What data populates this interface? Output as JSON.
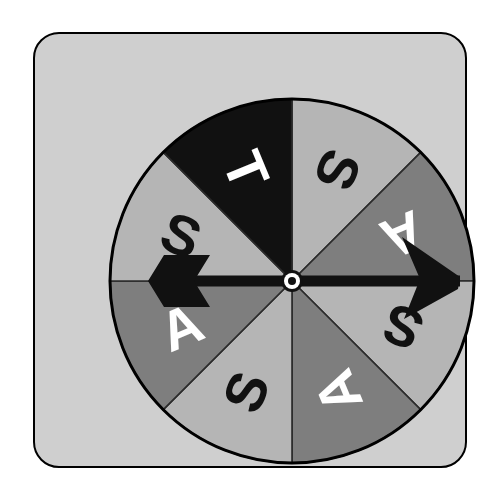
{
  "image": {
    "kind": "spinner-wheel-illustration",
    "background_color": "#ffffff"
  },
  "panel": {
    "name": "rounded-frame",
    "background_color": "#cfcfcf",
    "border_color": "#000000",
    "corner_radius": 26
  },
  "wheel": {
    "title": "eight-sector-spinner",
    "center_x": 186,
    "center_y": 186,
    "radius": 182,
    "rim_color": "#000000",
    "sector_count": 8,
    "sector_angle_deg": 45,
    "colors": {
      "light": "#b5b5b5",
      "dark": "#7e7e7e",
      "black": "#111111",
      "letter_dark": "#111111",
      "letter_light": "#ffffff"
    },
    "sectors": [
      {
        "index": 0,
        "label": "S",
        "fill": "#b5b5b5",
        "fill_name": "light",
        "text_color": "#111111",
        "start_deg": 0,
        "end_deg": 45,
        "label_angle_deg": 22.5,
        "label_rotation_deg": 112.5,
        "label_radius": 120
      },
      {
        "index": 1,
        "label": "A",
        "fill": "#7e7e7e",
        "fill_name": "dark",
        "text_color": "#ffffff",
        "start_deg": 45,
        "end_deg": 90,
        "label_angle_deg": 67.5,
        "label_rotation_deg": 157.5,
        "label_radius": 120
      },
      {
        "index": 2,
        "label": "S",
        "fill": "#b5b5b5",
        "fill_name": "light",
        "text_color": "#111111",
        "start_deg": 90,
        "end_deg": 135,
        "label_angle_deg": 112.5,
        "label_rotation_deg": 202.5,
        "label_radius": 120
      },
      {
        "index": 3,
        "label": "A",
        "fill": "#7e7e7e",
        "fill_name": "dark",
        "text_color": "#ffffff",
        "start_deg": 135,
        "end_deg": 180,
        "label_angle_deg": 157.5,
        "label_rotation_deg": 247.5,
        "label_radius": 120
      },
      {
        "index": 4,
        "label": "S",
        "fill": "#b5b5b5",
        "fill_name": "light",
        "text_color": "#111111",
        "start_deg": 180,
        "end_deg": 225,
        "label_angle_deg": 202.5,
        "label_rotation_deg": 292.5,
        "label_radius": 120
      },
      {
        "index": 5,
        "label": "A",
        "fill": "#7e7e7e",
        "fill_name": "dark",
        "text_color": "#ffffff",
        "start_deg": 225,
        "end_deg": 270,
        "label_angle_deg": 247.5,
        "label_rotation_deg": 337.5,
        "label_radius": 120
      },
      {
        "index": 6,
        "label": "S",
        "fill": "#b5b5b5",
        "fill_name": "light",
        "text_color": "#111111",
        "start_deg": 270,
        "end_deg": 315,
        "label_angle_deg": 292.5,
        "label_rotation_deg": 22.5,
        "label_radius": 120
      },
      {
        "index": 7,
        "label": "T",
        "fill": "#111111",
        "fill_name": "black",
        "text_color": "#ffffff",
        "start_deg": 315,
        "end_deg": 360,
        "label_angle_deg": 337.5,
        "label_rotation_deg": 67.5,
        "label_radius": 120
      }
    ],
    "pointer": {
      "name": "spinner-arrow",
      "color": "#111111",
      "direction_deg": 90,
      "direction_clock": "3 o'clock",
      "points_to_sector_index": 1,
      "points_to_label": "A",
      "tip_radius": 168,
      "tail_radius": 128
    },
    "hub": {
      "name": "center-hub",
      "outer_color": "#111111",
      "ring_color": "#ffffff",
      "inner_color": "#111111",
      "outer_radius": 11,
      "ring_radius": 8,
      "inner_radius": 4
    }
  }
}
